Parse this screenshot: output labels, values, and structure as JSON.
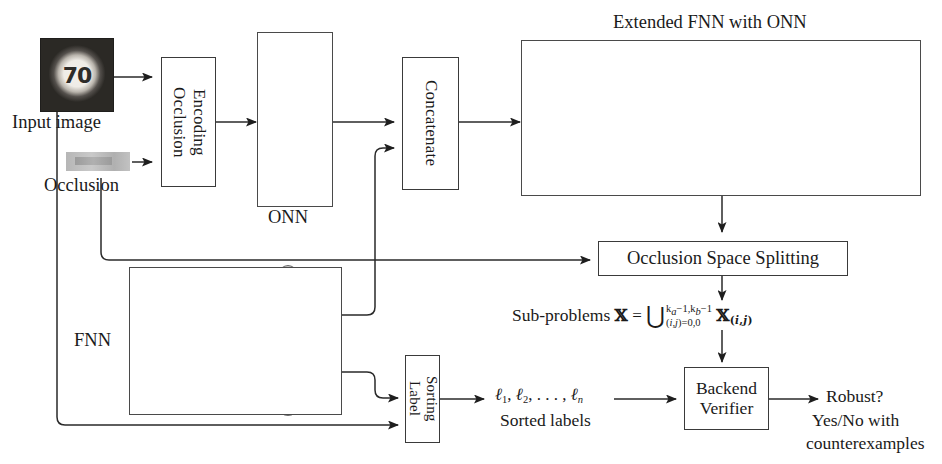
{
  "labels": {
    "input_image": "Input image",
    "occlusion": "Occlusion",
    "onn": "ONN",
    "fnn": "FNN",
    "extended_fnn_title": "Extended FNN with ONN",
    "sorted_labels": "Sorted labels",
    "subproblems_prefix": "Sub-problems",
    "robust_line1": "Robust?",
    "robust_line2": "Yes/No with",
    "robust_line3": "counterexamples"
  },
  "thumbnail": {
    "digits": "70",
    "alt": "speed-limit-70-traffic-sign"
  },
  "boxes": {
    "encoding_occlusion": "Encoding\nOcclusion",
    "encoding_occlusion_line1": "Encoding",
    "encoding_occlusion_line2": "Occlusion",
    "concatenate": "Concatenate",
    "occlusion_space_splitting": "Occlusion Space Splitting",
    "sorting_label_line1": "Sorting",
    "sorting_label_line2": "Label",
    "backend_verifier_line1": "Backend",
    "backend_verifier_line2": "Verifier"
  },
  "formulas": {
    "sorted_labels_seq": "ℓ₁, ℓ₂, . . . , ℓₙ",
    "sorted_label_items": [
      "ℓ1",
      "ℓ2",
      ". . .",
      "ℓn"
    ],
    "subproblems": {
      "lhs": "𝕏",
      "eq": "=",
      "operator": "⋃",
      "upper": "k_a−1,k_b−1",
      "upper_display": "ka−1,kb−1",
      "lower": "(i,j)=0,0",
      "rhs": "𝕏(i,j)"
    }
  },
  "networks": {
    "onn": {
      "layers": [
        3,
        3
      ],
      "note": "2-layer fully-connected ONN block"
    },
    "fnn": {
      "layers": [
        2,
        5,
        5,
        2
      ],
      "note": "feed-forward network"
    },
    "extended": {
      "layers": [
        3,
        3,
        2,
        4,
        4,
        2
      ],
      "note": "extended FNN with ONN merged"
    }
  },
  "colors": {
    "node_light": "#d8d8d8",
    "node_mid": "#bdbdbd",
    "node_dark": "#8e8e8e",
    "stroke": "#4a4a4a",
    "box_border": "#3a3a3a",
    "text": "#1a1a1a",
    "background": "#ffffff"
  }
}
